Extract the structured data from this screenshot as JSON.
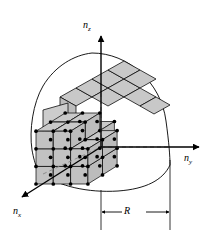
{
  "figure": {
    "type": "line-diagram",
    "title": "",
    "background_color": "#ffffff",
    "line_color": "#000000",
    "cube_fill_color": "#c8c8c8",
    "cube_edge_color": "#000000",
    "lattice_dot_color": "#000000",
    "dashed_line_color": "#808080"
  },
  "axes": [
    {
      "name": "n_z",
      "label": "n",
      "subscript": "z",
      "direction": "up"
    },
    {
      "name": "n_y",
      "label": "n",
      "subscript": "y",
      "direction": "right"
    },
    {
      "name": "n_x",
      "label": "n",
      "subscript": "x",
      "direction": "down-left"
    }
  ],
  "dimension": {
    "label": "R",
    "name": "radius-dimension",
    "arrows": "both"
  },
  "geometry": {
    "origin": {
      "x": 43,
      "y": 174
    },
    "radius_px": 125,
    "cube_count_x": 4,
    "cube_count_y": 4,
    "cube_count_z": 4
  }
}
